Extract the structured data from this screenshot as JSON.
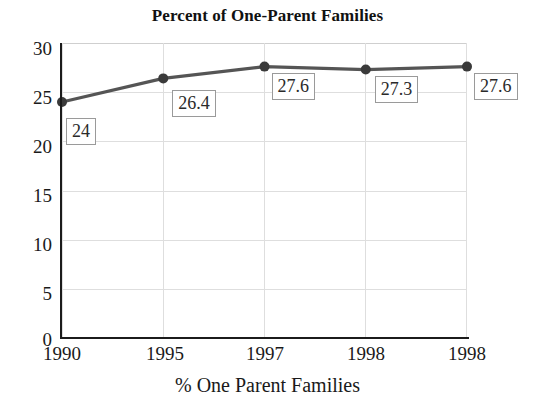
{
  "chart_data": {
    "type": "line",
    "title": "Percent of One-Parent Families",
    "xlabel": "% One Parent Families",
    "ylabel": "",
    "categories": [
      "1990",
      "1995",
      "1997",
      "1998",
      "1998"
    ],
    "values": [
      24,
      26.4,
      27.6,
      27.3,
      27.6
    ],
    "point_labels": [
      "24",
      "26.4",
      "27.6",
      "27.3",
      "27.6"
    ],
    "ylim": [
      0,
      30
    ],
    "y_ticks": [
      0,
      5,
      10,
      15,
      20,
      25,
      30
    ],
    "y_tick_labels": [
      "0",
      "5",
      "10",
      "15",
      "20",
      "25",
      "30"
    ],
    "grid": true,
    "grid_horizontal": true,
    "grid_vertical": true,
    "legend": false,
    "legend_position": "none",
    "series": [
      {
        "name": "% One Parent Families",
        "values": [
          24,
          26.4,
          27.6,
          27.3,
          27.6
        ],
        "line_color": "#555555",
        "marker_color": "#3a3a3a",
        "marker": "circle"
      }
    ],
    "colors": {
      "line": "#555555",
      "marker": "#3a3a3a",
      "axis": "#1b1b1b",
      "grid": "#dedede",
      "label_box_border": "#9a9a9a",
      "label_box_fill": "#ffffff",
      "text": "#1a1a1a",
      "background": "#ffffff"
    }
  }
}
